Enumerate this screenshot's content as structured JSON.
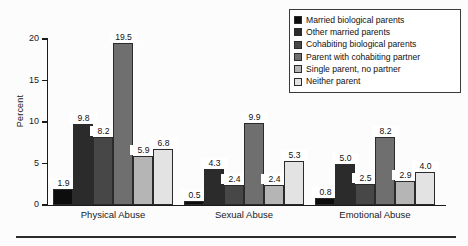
{
  "chart_data": {
    "type": "bar",
    "title": "",
    "subtitle": "",
    "xlabel": "",
    "ylabel": "Percent",
    "ylim": [
      0,
      20
    ],
    "yticks": [
      0,
      5,
      10,
      15,
      20
    ],
    "ytick_labels": [
      "0",
      "5",
      "10",
      "15",
      "20"
    ],
    "grid": false,
    "legend_position": "top-right",
    "categories": [
      "Physical Abuse",
      "Sexual Abuse",
      "Emotional Abuse"
    ],
    "series": [
      {
        "name": "Married biological parents",
        "color": "#0d0d0d",
        "values": [
          1.9,
          0.5,
          0.8
        ]
      },
      {
        "name": "Other married parents",
        "color": "#2b2b2b",
        "values": [
          9.8,
          4.3,
          5.0
        ]
      },
      {
        "name": "Cohabiting biological parents",
        "color": "#474747",
        "values": [
          8.2,
          2.4,
          2.5
        ]
      },
      {
        "name": "Parent with cohabiting partner",
        "color": "#6f6f6f",
        "values": [
          19.5,
          9.9,
          8.2
        ]
      },
      {
        "name": "Single parent, no partner",
        "color": "#b5b5b5",
        "values": [
          5.9,
          2.4,
          2.9
        ]
      },
      {
        "name": "Neither parent",
        "color": "#e3e3e3",
        "values": [
          6.8,
          5.3,
          4.0
        ]
      }
    ],
    "value_labels": {
      "Physical Abuse": [
        "1.9",
        "9.8",
        "8.2",
        "19.5",
        "5.9",
        "6.8"
      ],
      "Sexual Abuse": [
        "0.5",
        "4.3",
        "2.4",
        "9.9",
        "2.4",
        "5.3"
      ],
      "Emotional Abuse": [
        "0.8",
        "5.0",
        "2.5",
        "8.2",
        "2.9",
        "4.0"
      ]
    }
  },
  "axis": {
    "y_label": "Percent",
    "y_ticks": [
      "20",
      "15",
      "10",
      "5",
      "0"
    ]
  },
  "legend": {
    "items": [
      {
        "label": "Married biological parents",
        "color": "#0d0d0d"
      },
      {
        "label": "Other married parents",
        "color": "#2b2b2b"
      },
      {
        "label": "Cohabiting biological parents",
        "color": "#474747"
      },
      {
        "label": "Parent with cohabiting partner",
        "color": "#6f6f6f"
      },
      {
        "label": "Single parent, no partner",
        "color": "#b5b5b5"
      },
      {
        "label": "Neither parent",
        "color": "#e3e3e3"
      }
    ]
  },
  "groups": {
    "labels": [
      "Physical Abuse",
      "Sexual Abuse",
      "Emotional Abuse"
    ]
  }
}
